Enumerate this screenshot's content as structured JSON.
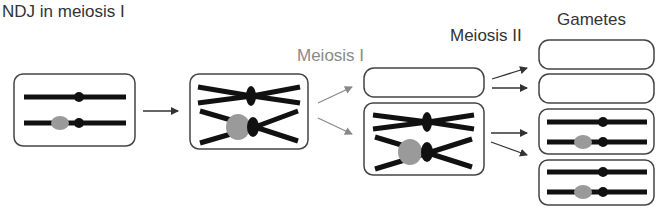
{
  "labels": {
    "title": "NDJ in meiosis I",
    "meiosis1": "Meiosis I",
    "meiosis2": "Meiosis II",
    "gametes": "Gametes"
  },
  "colors": {
    "chromosome": "#111111",
    "centromere": "#111111",
    "marker": "#9a9a9a",
    "box_border": "#444444",
    "arrow": "#333333",
    "arrow_grey": "#8a8a8a"
  },
  "cells": [
    {
      "id": "parent-cell",
      "stage": "NDJ in meiosis I",
      "content": "two homologous chromosomes, one with grey marker"
    },
    {
      "id": "metaphase-I-cell",
      "stage": "before Meiosis I",
      "content": "two replicated homolog pairs (X shapes)"
    },
    {
      "id": "meiosis-I-empty-cell",
      "stage": "Meiosis I",
      "content": "empty"
    },
    {
      "id": "meiosis-I-full-cell",
      "stage": "Meiosis I",
      "content": "both replicated homolog pairs"
    },
    {
      "id": "gamete-1",
      "stage": "Gametes",
      "content": "empty"
    },
    {
      "id": "gamete-2",
      "stage": "Gametes",
      "content": "empty"
    },
    {
      "id": "gamete-3",
      "stage": "Gametes",
      "content": "two chromosomes, one with grey marker"
    },
    {
      "id": "gamete-4",
      "stage": "Gametes",
      "content": "two chromosomes, one with grey marker"
    }
  ]
}
